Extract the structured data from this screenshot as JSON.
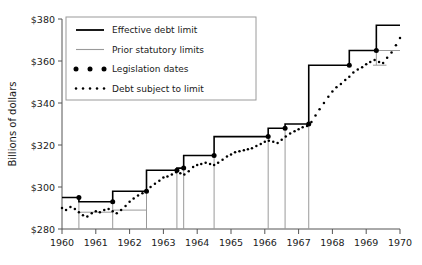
{
  "chart_data": {
    "type": "line",
    "title": "",
    "xlabel": "",
    "ylabel": "Billions of dollars",
    "xlim": [
      1960,
      1970
    ],
    "ylim": [
      280,
      380
    ],
    "ytick_labels": [
      "$280",
      "$300",
      "$320",
      "$340",
      "$360",
      "$380"
    ],
    "yticks": [
      280,
      300,
      320,
      340,
      360,
      380
    ],
    "xtick_labels": [
      "1960",
      "1961",
      "1962",
      "1963",
      "1964",
      "1965",
      "1966",
      "1967",
      "1968",
      "1969",
      "1970"
    ],
    "xticks": [
      1960,
      1961,
      1962,
      1963,
      1964,
      1965,
      1966,
      1967,
      1968,
      1969,
      1970
    ],
    "grid": false,
    "legend_position": "upper-left",
    "legend": [
      {
        "key": "effective_debt_limit",
        "label": "Effective debt limit",
        "marker": "solid-line",
        "color": "#000000"
      },
      {
        "key": "prior_statutory_limits",
        "label": "Prior statutory limits",
        "marker": "solid-line",
        "color": "#9a9a9a"
      },
      {
        "key": "legislation_dates",
        "label": "Legislation dates",
        "marker": "dots",
        "color": "#000000"
      },
      {
        "key": "debt_subject_to_limit",
        "label": "Debt subject to limit",
        "marker": "dotted-line",
        "color": "#000000"
      }
    ],
    "series": [
      {
        "name": "Effective debt limit",
        "type": "step",
        "color": "#000000",
        "points": [
          {
            "x": 1960.0,
            "y": 295.0
          },
          {
            "x": 1960.5,
            "y": 295.0
          },
          {
            "x": 1960.5,
            "y": 293.0
          },
          {
            "x": 1961.5,
            "y": 293.0
          },
          {
            "x": 1961.5,
            "y": 298.0
          },
          {
            "x": 1962.5,
            "y": 298.0
          },
          {
            "x": 1962.5,
            "y": 308.0
          },
          {
            "x": 1963.4,
            "y": 308.0
          },
          {
            "x": 1963.4,
            "y": 309.0
          },
          {
            "x": 1963.6,
            "y": 309.0
          },
          {
            "x": 1963.6,
            "y": 315.0
          },
          {
            "x": 1964.5,
            "y": 315.0
          },
          {
            "x": 1964.5,
            "y": 324.0
          },
          {
            "x": 1966.1,
            "y": 324.0
          },
          {
            "x": 1966.1,
            "y": 328.0
          },
          {
            "x": 1966.6,
            "y": 328.0
          },
          {
            "x": 1966.6,
            "y": 330.0
          },
          {
            "x": 1967.3,
            "y": 330.0
          },
          {
            "x": 1967.3,
            "y": 358.0
          },
          {
            "x": 1968.5,
            "y": 358.0
          },
          {
            "x": 1968.5,
            "y": 365.0
          },
          {
            "x": 1969.3,
            "y": 365.0
          },
          {
            "x": 1969.3,
            "y": 377.0
          },
          {
            "x": 1970.0,
            "y": 377.0
          }
        ]
      },
      {
        "name": "Prior statutory limits",
        "type": "vertical-drops",
        "color": "#9a9a9a",
        "segments": [
          {
            "x": 1960.5,
            "y_top": 295.0,
            "y_bottom": 280.0
          },
          {
            "x": 1961.5,
            "y_top": 293.0,
            "y_bottom": 280.0
          },
          {
            "x": 1962.5,
            "y_top": 298.0,
            "y_bottom": 280.0
          },
          {
            "x": 1963.4,
            "y_top": 308.0,
            "y_bottom": 280.0
          },
          {
            "x": 1963.6,
            "y_top": 309.0,
            "y_bottom": 280.0
          },
          {
            "x": 1964.5,
            "y_top": 315.0,
            "y_bottom": 280.0
          },
          {
            "x": 1966.1,
            "y_top": 324.0,
            "y_bottom": 280.0
          },
          {
            "x": 1966.6,
            "y_top": 328.0,
            "y_bottom": 280.0
          },
          {
            "x": 1967.3,
            "y_top": 330.0,
            "y_bottom": 280.0
          },
          {
            "x": 1969.3,
            "y_top": 365.0,
            "y_bottom": 358.0
          }
        ],
        "horizontals": [
          {
            "x0": 1960.5,
            "x1": 1961.5,
            "y": 288.0
          },
          {
            "x0": 1961.5,
            "x1": 1962.5,
            "y": 289.0
          },
          {
            "x0": 1969.3,
            "x1": 1970.0,
            "y": 365.0
          },
          {
            "x0": 1969.2,
            "x1": 1969.6,
            "y": 358.0
          }
        ]
      },
      {
        "name": "Debt subject to limit",
        "type": "dotted",
        "color": "#000000",
        "points": [
          {
            "x": 1960.0,
            "y": 290.0
          },
          {
            "x": 1960.12,
            "y": 289.0
          },
          {
            "x": 1960.25,
            "y": 290.5
          },
          {
            "x": 1960.38,
            "y": 289.5
          },
          {
            "x": 1960.5,
            "y": 288.0
          },
          {
            "x": 1960.62,
            "y": 286.5
          },
          {
            "x": 1960.75,
            "y": 286.0
          },
          {
            "x": 1960.88,
            "y": 287.5
          },
          {
            "x": 1961.0,
            "y": 288.5
          },
          {
            "x": 1961.12,
            "y": 288.0
          },
          {
            "x": 1961.25,
            "y": 289.0
          },
          {
            "x": 1961.38,
            "y": 289.5
          },
          {
            "x": 1961.5,
            "y": 288.5
          },
          {
            "x": 1961.62,
            "y": 287.5
          },
          {
            "x": 1961.75,
            "y": 289.0
          },
          {
            "x": 1961.88,
            "y": 291.0
          },
          {
            "x": 1962.0,
            "y": 293.0
          },
          {
            "x": 1962.12,
            "y": 294.5
          },
          {
            "x": 1962.25,
            "y": 296.0
          },
          {
            "x": 1962.38,
            "y": 297.0
          },
          {
            "x": 1962.5,
            "y": 298.5
          },
          {
            "x": 1962.62,
            "y": 300.0
          },
          {
            "x": 1962.75,
            "y": 301.5
          },
          {
            "x": 1962.88,
            "y": 303.0
          },
          {
            "x": 1963.0,
            "y": 304.5
          },
          {
            "x": 1963.12,
            "y": 305.0
          },
          {
            "x": 1963.25,
            "y": 306.0
          },
          {
            "x": 1963.38,
            "y": 307.0
          },
          {
            "x": 1963.5,
            "y": 306.5
          },
          {
            "x": 1963.62,
            "y": 306.0
          },
          {
            "x": 1963.75,
            "y": 307.5
          },
          {
            "x": 1963.88,
            "y": 309.5
          },
          {
            "x": 1964.0,
            "y": 310.5
          },
          {
            "x": 1964.12,
            "y": 311.0
          },
          {
            "x": 1964.25,
            "y": 311.5
          },
          {
            "x": 1964.38,
            "y": 311.0
          },
          {
            "x": 1964.5,
            "y": 310.5
          },
          {
            "x": 1964.62,
            "y": 311.5
          },
          {
            "x": 1964.75,
            "y": 313.0
          },
          {
            "x": 1964.88,
            "y": 314.5
          },
          {
            "x": 1965.0,
            "y": 315.5
          },
          {
            "x": 1965.12,
            "y": 316.5
          },
          {
            "x": 1965.25,
            "y": 317.0
          },
          {
            "x": 1965.38,
            "y": 317.5
          },
          {
            "x": 1965.5,
            "y": 318.0
          },
          {
            "x": 1965.62,
            "y": 318.5
          },
          {
            "x": 1965.75,
            "y": 319.5
          },
          {
            "x": 1965.88,
            "y": 320.5
          },
          {
            "x": 1966.0,
            "y": 321.5
          },
          {
            "x": 1966.12,
            "y": 322.0
          },
          {
            "x": 1966.25,
            "y": 321.5
          },
          {
            "x": 1966.38,
            "y": 321.0
          },
          {
            "x": 1966.5,
            "y": 322.5
          },
          {
            "x": 1966.62,
            "y": 324.0
          },
          {
            "x": 1966.75,
            "y": 325.5
          },
          {
            "x": 1966.88,
            "y": 326.5
          },
          {
            "x": 1967.0,
            "y": 327.5
          },
          {
            "x": 1967.12,
            "y": 328.5
          },
          {
            "x": 1967.25,
            "y": 329.0
          },
          {
            "x": 1967.38,
            "y": 331.0
          },
          {
            "x": 1967.5,
            "y": 334.0
          },
          {
            "x": 1967.62,
            "y": 337.0
          },
          {
            "x": 1967.75,
            "y": 340.0
          },
          {
            "x": 1967.88,
            "y": 343.0
          },
          {
            "x": 1968.0,
            "y": 345.5
          },
          {
            "x": 1968.12,
            "y": 347.5
          },
          {
            "x": 1968.25,
            "y": 349.0
          },
          {
            "x": 1968.38,
            "y": 351.0
          },
          {
            "x": 1968.5,
            "y": 352.5
          },
          {
            "x": 1968.62,
            "y": 354.5
          },
          {
            "x": 1968.75,
            "y": 356.0
          },
          {
            "x": 1968.88,
            "y": 357.0
          },
          {
            "x": 1969.0,
            "y": 358.5
          },
          {
            "x": 1969.12,
            "y": 359.5
          },
          {
            "x": 1969.25,
            "y": 360.5
          },
          {
            "x": 1969.38,
            "y": 359.5
          },
          {
            "x": 1969.5,
            "y": 359.0
          },
          {
            "x": 1969.62,
            "y": 361.5
          },
          {
            "x": 1969.75,
            "y": 364.0
          },
          {
            "x": 1969.88,
            "y": 367.5
          },
          {
            "x": 1970.0,
            "y": 371.0
          }
        ]
      },
      {
        "name": "Legislation dates",
        "type": "scatter",
        "color": "#000000",
        "points": [
          {
            "x": 1960.5,
            "y": 295.0
          },
          {
            "x": 1961.5,
            "y": 293.0
          },
          {
            "x": 1962.5,
            "y": 298.0
          },
          {
            "x": 1963.4,
            "y": 308.0
          },
          {
            "x": 1963.6,
            "y": 309.0
          },
          {
            "x": 1964.5,
            "y": 315.0
          },
          {
            "x": 1966.1,
            "y": 324.0
          },
          {
            "x": 1966.6,
            "y": 328.0
          },
          {
            "x": 1967.3,
            "y": 330.0
          },
          {
            "x": 1968.5,
            "y": 358.0
          },
          {
            "x": 1969.3,
            "y": 365.0
          }
        ]
      }
    ]
  }
}
